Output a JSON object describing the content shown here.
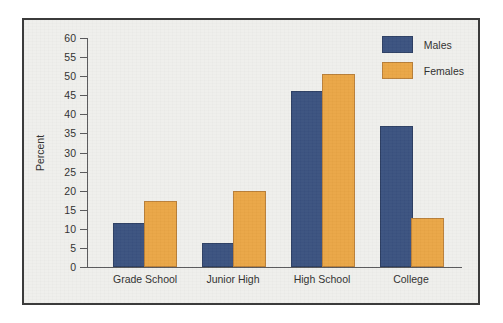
{
  "chart_data": {
    "type": "bar",
    "title": "",
    "xlabel": "",
    "ylabel": "Percent",
    "ylim": [
      0,
      60
    ],
    "ytick_step": 5,
    "yticks": [
      "60",
      "55",
      "50",
      "45",
      "40",
      "35",
      "30",
      "25",
      "20",
      "15",
      "10",
      "5",
      "0"
    ],
    "grid": false,
    "legend_position": "top-right",
    "categories": [
      "Grade School",
      "Junior High",
      "High School",
      "College"
    ],
    "series": [
      {
        "name": "Males",
        "color": "#3b5280",
        "values": [
          11.0,
          5.8,
          45.5,
          36.3
        ]
      },
      {
        "name": "Females",
        "color": "#eaa646",
        "values": [
          16.8,
          19.5,
          50.0,
          12.3
        ]
      }
    ]
  },
  "figure": {
    "background": "#efefec",
    "border_color": "#3b3b3b",
    "axis_color": "#58585a"
  }
}
